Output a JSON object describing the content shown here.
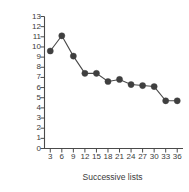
{
  "chart_data": {
    "type": "line",
    "title": "",
    "subtitle": "",
    "xlabel": "Successive lists",
    "ylabel": "Mean number of trials to criterion",
    "x": [
      3,
      6,
      9,
      12,
      15,
      18,
      21,
      24,
      27,
      30,
      33,
      36
    ],
    "values": [
      9.6,
      11.1,
      9.1,
      7.4,
      7.4,
      6.6,
      6.8,
      6.3,
      6.2,
      6.1,
      4.7,
      4.7
    ],
    "series": [
      {
        "name": "Mean trials to criterion",
        "values": [
          9.6,
          11.1,
          9.1,
          7.4,
          7.4,
          6.6,
          6.8,
          6.3,
          6.2,
          6.1,
          4.7,
          4.7
        ]
      }
    ],
    "xtick_labels": [
      "3",
      "6",
      "9",
      "12",
      "15",
      "18",
      "21",
      "24",
      "27",
      "30",
      "33",
      "36"
    ],
    "ytick_labels": [
      "0",
      "1",
      "2",
      "3",
      "4",
      "5",
      "6",
      "7",
      "8",
      "9",
      "10",
      "11",
      "12",
      "13"
    ],
    "xlim": [
      1.5,
      37.5
    ],
    "ylim": [
      0,
      13
    ],
    "grid": false,
    "legend": null,
    "marker": "filled-circle",
    "marker_color": "#3f3f3f",
    "line_color": "#4a4a4a",
    "axis_color": "#4a4a4a",
    "annotations": []
  }
}
